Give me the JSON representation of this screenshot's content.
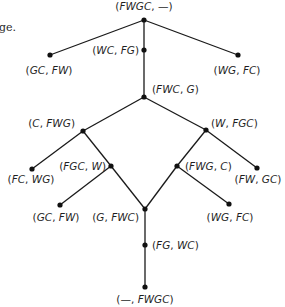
{
  "page": {
    "clipped_text": "ge."
  },
  "diagram": {
    "title": "",
    "nodes": [
      {
        "id": "n0",
        "left": "FWGC",
        "right": "—",
        "x": 144,
        "y": 20,
        "lx": 144,
        "ly": 10,
        "anchor": "middle"
      },
      {
        "id": "n1",
        "left": "GC",
        "right": "FW",
        "x": 50,
        "y": 55,
        "lx": 49,
        "ly": 74,
        "anchor": "middle"
      },
      {
        "id": "n2",
        "left": "WC",
        "right": "FG",
        "x": 144,
        "y": 50,
        "lx": 139,
        "ly": 54,
        "anchor": "end"
      },
      {
        "id": "n3",
        "left": "WG",
        "right": "FC",
        "x": 238,
        "y": 55,
        "lx": 237,
        "ly": 74,
        "anchor": "middle"
      },
      {
        "id": "n4",
        "left": "FWC",
        "right": "G",
        "x": 144,
        "y": 97,
        "lx": 152,
        "ly": 93,
        "anchor": "start"
      },
      {
        "id": "n5",
        "left": "C",
        "right": "FWG",
        "x": 83,
        "y": 131,
        "lx": 75,
        "ly": 127,
        "anchor": "end"
      },
      {
        "id": "n6",
        "left": "W",
        "right": "FGC",
        "x": 206,
        "y": 130,
        "lx": 211,
        "ly": 127,
        "anchor": "start"
      },
      {
        "id": "n7",
        "left": "FC",
        "right": "WG",
        "x": 32,
        "y": 169,
        "lx": 31,
        "ly": 183,
        "anchor": "middle"
      },
      {
        "id": "n8",
        "left": "FGC",
        "right": "W",
        "x": 111,
        "y": 166,
        "lx": 106,
        "ly": 170,
        "anchor": "end"
      },
      {
        "id": "n9",
        "left": "FWG",
        "right": "C",
        "x": 177,
        "y": 166,
        "lx": 185,
        "ly": 170,
        "anchor": "start"
      },
      {
        "id": "n10",
        "left": "FW",
        "right": "GC",
        "x": 257,
        "y": 168,
        "lx": 258,
        "ly": 183,
        "anchor": "middle"
      },
      {
        "id": "n11",
        "left": "GC",
        "right": "FW",
        "x": 60,
        "y": 205,
        "lx": 56,
        "ly": 221,
        "anchor": "middle"
      },
      {
        "id": "n12",
        "left": "G",
        "right": "FWC",
        "x": 145,
        "y": 209,
        "lx": 139,
        "ly": 221,
        "anchor": "end"
      },
      {
        "id": "n13",
        "left": "WG",
        "right": "FC",
        "x": 229,
        "y": 204,
        "lx": 230,
        "ly": 221,
        "anchor": "middle"
      },
      {
        "id": "n14",
        "left": "FG",
        "right": "WC",
        "x": 145,
        "y": 245,
        "lx": 152,
        "ly": 249,
        "anchor": "start"
      },
      {
        "id": "n15",
        "left": "—",
        "right": "FWGC",
        "x": 145,
        "y": 287,
        "lx": 145,
        "ly": 303,
        "anchor": "middle"
      }
    ],
    "edges": [
      [
        "n0",
        "n1"
      ],
      [
        "n0",
        "n2"
      ],
      [
        "n0",
        "n3"
      ],
      [
        "n2",
        "n4"
      ],
      [
        "n4",
        "n5"
      ],
      [
        "n4",
        "n6"
      ],
      [
        "n5",
        "n7"
      ],
      [
        "n5",
        "n8"
      ],
      [
        "n6",
        "n9"
      ],
      [
        "n6",
        "n10"
      ],
      [
        "n8",
        "n11"
      ],
      [
        "n8",
        "n12"
      ],
      [
        "n9",
        "n12"
      ],
      [
        "n9",
        "n13"
      ],
      [
        "n12",
        "n14"
      ],
      [
        "n14",
        "n15"
      ]
    ],
    "style": {
      "line_color": "#1a1a1a",
      "node_color": "#111111",
      "text_color": "#1f1f1f",
      "node_radius": 2.6
    }
  }
}
